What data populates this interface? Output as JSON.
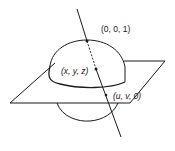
{
  "figure": {
    "labels": {
      "north_pole": "(0, 0, 1)",
      "sphere_point": "(x, y, z)",
      "plane_point": "(u, v, 0)"
    },
    "colors": {
      "ink": "#1a1a1a",
      "background": "#ffffff"
    }
  }
}
